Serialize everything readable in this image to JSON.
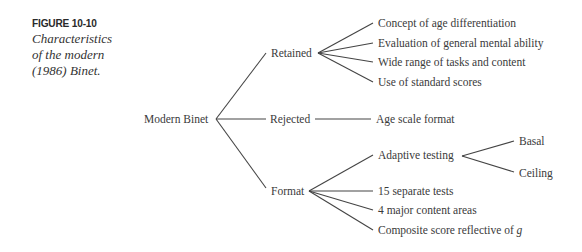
{
  "figure": {
    "number": "FIGURE 10-10",
    "title": "Characteristics of the modern (1986) Binet."
  },
  "tree": {
    "root": "Modern Binet",
    "branches": [
      {
        "label": "Retained",
        "children": [
          "Concept of age differentiation",
          "Evaluation of general mental ability",
          "Wide range of tasks and content",
          "Use of standard scores"
        ]
      },
      {
        "label": "Rejected",
        "children": [
          "Age scale format"
        ]
      },
      {
        "label": "Format",
        "children": [
          {
            "label": "Adaptive testing",
            "children": [
              "Basal",
              "Ceiling"
            ]
          },
          "15 separate tests",
          "4 major content areas",
          {
            "label_prefix": "Composite score reflective of ",
            "label_italic": "g"
          }
        ]
      }
    ]
  },
  "colors": {
    "text": "#3a3a3a",
    "line": "#444444",
    "background": "#ffffff"
  }
}
